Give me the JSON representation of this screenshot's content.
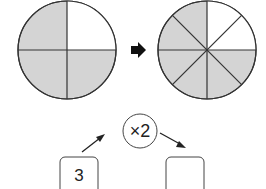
{
  "diagram": {
    "left_circle": {
      "parts": 4,
      "shaded": 3,
      "shaded_color": "#d4d4d4",
      "line_color": "#333333"
    },
    "right_circle": {
      "parts": 8,
      "shaded": 6,
      "shaded_color": "#d4d4d4",
      "line_color": "#333333"
    },
    "transform_arrow": "right-arrow",
    "operator": {
      "text": "×2"
    },
    "left_box": {
      "value": "3"
    },
    "right_box": {
      "value": ""
    }
  }
}
